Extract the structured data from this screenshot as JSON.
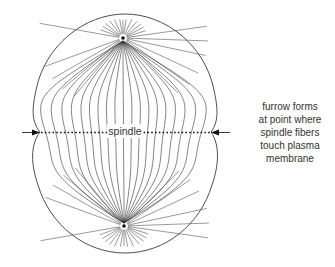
{
  "diagram": {
    "labels": {
      "spindle": "spindle",
      "annotation_lines": [
        "furrow forms",
        "at point where",
        "spindle fibers",
        "touch plasma",
        "membrane"
      ]
    },
    "structures": [
      "cell membrane outline",
      "top pole (centrosome)",
      "bottom pole (centrosome)",
      "astral rays",
      "spindle fibers",
      "equatorial plane",
      "left furrow arrow",
      "right furrow arrow"
    ],
    "colors": {
      "line": "#333333",
      "background": "#ffffff"
    }
  }
}
